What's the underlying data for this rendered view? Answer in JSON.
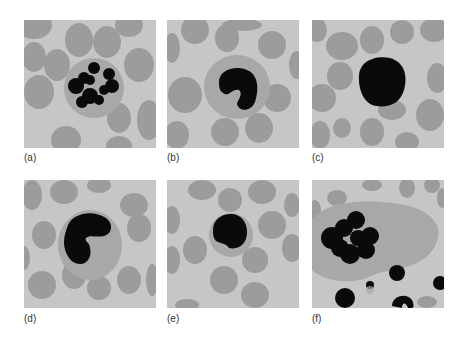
{
  "figure": {
    "panels": [
      {
        "id": "a",
        "label": "(a)",
        "description": "Cell with multiple clumped dark granular nuclear lobes inside a pale round cytoplasm, surrounded by red blood cells"
      },
      {
        "id": "b",
        "label": "(b)",
        "description": "Cell with a dark kidney/bean-shaped nucleus inside a round gray cytoplasm"
      },
      {
        "id": "c",
        "label": "(c)",
        "description": "Small cell almost entirely filled by a round dark nucleus"
      },
      {
        "id": "d",
        "label": "(d)",
        "description": "Cell with a large folded dark nucleus inside a round cytoplasm"
      },
      {
        "id": "e",
        "label": "(e)",
        "description": "Small cell with round dark nucleus and thin rim of cytoplasm"
      },
      {
        "id": "f",
        "label": "(f)",
        "description": "Very large irregular cell with multilobed dark nucleus, with small dark fragments nearby"
      }
    ]
  },
  "colors": {
    "background": "#c6c6c6",
    "rbc": "#9c9c9c",
    "cytoplasm": "#a8a8a8",
    "nucleus": "#0a0a0a"
  }
}
